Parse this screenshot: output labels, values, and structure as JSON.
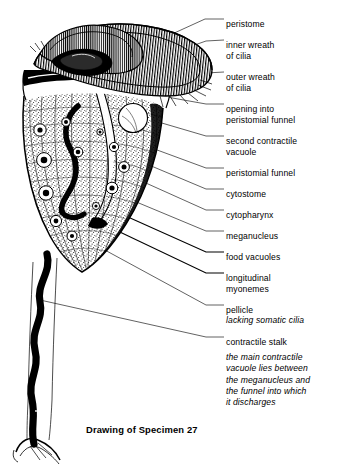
{
  "figure": {
    "caption": "Drawing of Specimen 27",
    "background_color": "#ffffff",
    "ink_color": "#000000"
  },
  "labels": [
    {
      "id": "peristome",
      "lines": [
        "peristome"
      ],
      "x": 226,
      "y": 19,
      "anchor_x": 148,
      "anchor_y": 45
    },
    {
      "id": "inner-wreath-of-cilia",
      "lines": [
        "inner wreath",
        "of cilia"
      ],
      "x": 226,
      "y": 40,
      "anchor_x": 158,
      "anchor_y": 58
    },
    {
      "id": "outer-wreath-of-cilia",
      "lines": [
        "outer wreath",
        "of cilia"
      ],
      "x": 226,
      "y": 72,
      "anchor_x": 172,
      "anchor_y": 76
    },
    {
      "id": "opening-into-peristomial-funnel",
      "lines": [
        "opening into",
        "peristomial funnel"
      ],
      "x": 226,
      "y": 104,
      "anchor_x": 150,
      "anchor_y": 96
    },
    {
      "id": "second-contractile-vacuole",
      "lines": [
        "second contractile",
        "vacuole"
      ],
      "x": 226,
      "y": 136,
      "anchor_x": 140,
      "anchor_y": 118
    },
    {
      "id": "peristomial-funnel",
      "lines": [
        "peristomial funnel"
      ],
      "x": 226,
      "y": 168,
      "anchor_x": 132,
      "anchor_y": 140
    },
    {
      "id": "cytostome",
      "lines": [
        "cytostome"
      ],
      "x": 226,
      "y": 189,
      "anchor_x": 120,
      "anchor_y": 152
    },
    {
      "id": "cytopharynx",
      "lines": [
        "cytopharynx"
      ],
      "x": 226,
      "y": 210,
      "anchor_x": 110,
      "anchor_y": 166
    },
    {
      "id": "meganucleus",
      "lines": [
        "meganucleus"
      ],
      "x": 226,
      "y": 231,
      "anchor_x": 100,
      "anchor_y": 186
    },
    {
      "id": "food-vacuoles",
      "lines": [
        "food vacuoles"
      ],
      "x": 226,
      "y": 252,
      "anchor_x": 92,
      "anchor_y": 200
    },
    {
      "id": "longitudinal-myonemes",
      "lines": [
        "longitudinal",
        "myonemes"
      ],
      "x": 226,
      "y": 273,
      "anchor_x": 84,
      "anchor_y": 214
    },
    {
      "id": "pellicle",
      "lines": [
        "pellicle"
      ],
      "x": 226,
      "y": 305,
      "anchor_x": 70,
      "anchor_y": 230
    },
    {
      "id": "pellicle-sub",
      "lines": [
        "lacking somatic cilia"
      ],
      "italic": true,
      "x": 226,
      "y": 315,
      "anchor_x": null,
      "anchor_y": null
    },
    {
      "id": "contractile-stalk",
      "lines": [
        "contractile stalk"
      ],
      "x": 226,
      "y": 337,
      "anchor_x": 38,
      "anchor_y": 300
    }
  ],
  "note": {
    "id": "main-contractile-vacuole-note",
    "lines": [
      "the main contractile",
      "vacuole lies between",
      "the meganucleus and",
      "the funnel into which",
      "it discharges"
    ]
  }
}
